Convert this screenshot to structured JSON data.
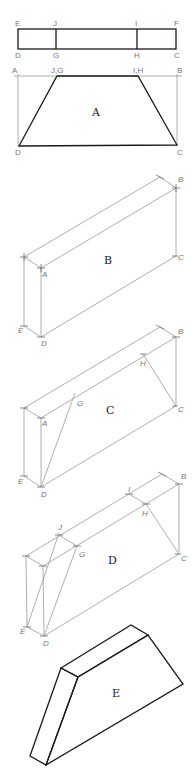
{
  "figures": {
    "top_view": {
      "points": {
        "E": "E",
        "J": "J",
        "I": "I",
        "F": "F",
        "D": "D",
        "G": "G",
        "H": "H",
        "C": "C"
      }
    },
    "A": {
      "label": "A",
      "points": {
        "A": "A",
        "JG": "J,G",
        "IH": "I,H",
        "B": "B",
        "D": "D",
        "C": "C"
      }
    },
    "B": {
      "label": "B",
      "points": {
        "A": "A",
        "B": "B",
        "C": "C",
        "D": "D",
        "E": "E"
      }
    },
    "C": {
      "label": "C",
      "points": {
        "A": "A",
        "B": "B",
        "C": "C",
        "D": "D",
        "E": "E",
        "G": "G",
        "H": "H"
      }
    },
    "D": {
      "label": "D",
      "points": {
        "A": "",
        "B": "B",
        "C": "C",
        "D": "D",
        "E": "E",
        "G": "G",
        "H": "H",
        "I": "I",
        "J": "J"
      }
    },
    "E": {
      "label": "E"
    }
  },
  "colors": {
    "construction_line": "#9a9a9a",
    "object_line": "#1a1a1a",
    "label": "#777777"
  }
}
